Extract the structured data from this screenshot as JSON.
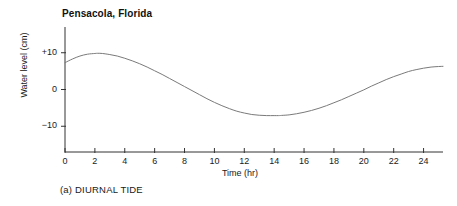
{
  "figure": {
    "caption": "(a) DIURNAL TIDE"
  },
  "chart_data": {
    "type": "line",
    "title": "Pensacola, Florida",
    "xlabel": "Time (hr)",
    "ylabel": "Water level (cm)",
    "xlim": [
      0,
      25.3
    ],
    "ylim": [
      -17,
      17
    ],
    "xticks": [
      0,
      2,
      4,
      6,
      8,
      10,
      12,
      14,
      16,
      18,
      20,
      22,
      24
    ],
    "xtick_labels": [
      "0",
      "2",
      "4",
      "6",
      "8",
      "10",
      "12",
      "14",
      "16",
      "18",
      "20",
      "22",
      "24"
    ],
    "yticks": [
      10,
      0,
      -10
    ],
    "ytick_labels": [
      "+10",
      "0",
      "−10"
    ],
    "grid": false,
    "legend": null,
    "line_color": "#7a7a7a",
    "line_width": 1.0,
    "series": [
      {
        "name": "Water level",
        "x": [
          0,
          0.5,
          1,
          1.5,
          2,
          2.2,
          2.5,
          3,
          3.5,
          4,
          4.5,
          5,
          5.5,
          6,
          6.5,
          7,
          7.5,
          8,
          8.5,
          9,
          9.5,
          10,
          10.5,
          11,
          11.5,
          12,
          12.5,
          13,
          13.5,
          14,
          14.3,
          14.5,
          15,
          15.5,
          16,
          16.5,
          17,
          17.5,
          18,
          18.5,
          19,
          19.5,
          20,
          20.5,
          21,
          21.5,
          22,
          22.5,
          23,
          23.5,
          24,
          24.5,
          25,
          25.3
        ],
        "y": [
          7.3,
          8.3,
          9.1,
          9.6,
          9.8,
          9.85,
          9.8,
          9.5,
          9.1,
          8.5,
          7.8,
          7.0,
          6.1,
          5.1,
          4.1,
          3.0,
          1.9,
          0.8,
          -0.3,
          -1.4,
          -2.5,
          -3.5,
          -4.4,
          -5.2,
          -5.9,
          -6.4,
          -6.8,
          -7.0,
          -7.1,
          -7.1,
          -7.1,
          -7.05,
          -6.9,
          -6.6,
          -6.2,
          -5.7,
          -5.1,
          -4.4,
          -3.6,
          -2.8,
          -1.9,
          -1.0,
          -0.1,
          0.9,
          1.8,
          2.7,
          3.5,
          4.2,
          4.9,
          5.4,
          5.8,
          6.1,
          6.25,
          6.3
        ]
      }
    ],
    "annotations": {
      "peak_hour": 2.2,
      "peak_value": 9.85,
      "trough_hour": 14.2,
      "trough_value": -7.1,
      "start_value": 7.3,
      "end_value": 6.3
    }
  }
}
